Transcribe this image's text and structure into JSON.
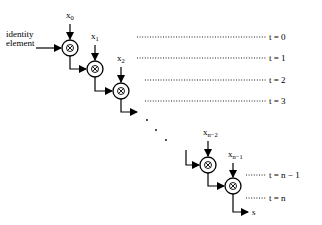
{
  "diagram": {
    "input_label_line1": "identity",
    "input_label_line2": "element",
    "operator_symbol": "⊗",
    "inputs": [
      {
        "base": "x",
        "sub": "0"
      },
      {
        "base": "x",
        "sub": "1"
      },
      {
        "base": "x",
        "sub": "2"
      },
      {
        "base": "x",
        "sub": "n−2"
      },
      {
        "base": "x",
        "sub": "n−1"
      }
    ],
    "time_labels": [
      "t = 0",
      "t = 1",
      "t = 2",
      "t = 3",
      "t = n − 1",
      "t = n"
    ],
    "output_label": "s",
    "ellipsis": "· · ·"
  }
}
